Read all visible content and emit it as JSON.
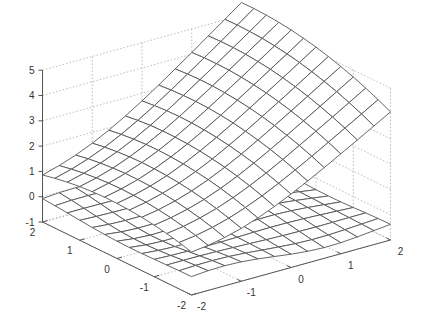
{
  "chart_data": {
    "type": "surface",
    "title": "",
    "xlabel": "",
    "ylabel": "",
    "zlabel": "",
    "grid": true,
    "view": "matlab-3d-default",
    "axes": {
      "x": {
        "range": [
          -2,
          2
        ],
        "ticks": [
          -2,
          -1,
          0,
          1,
          2
        ]
      },
      "y": {
        "range": [
          -2,
          2
        ],
        "ticks": [
          -2,
          -1,
          0,
          1,
          2
        ]
      },
      "z": {
        "range": [
          -1,
          5
        ],
        "ticks": [
          -1,
          0,
          1,
          2,
          3,
          4,
          5
        ]
      }
    },
    "tick_labels": {
      "x": [
        "-2",
        "-1",
        "0",
        "1",
        "2"
      ],
      "y": [
        "-2",
        "-1",
        "0",
        "1",
        "2"
      ],
      "z": [
        "-1",
        "0",
        "1",
        "2",
        "3",
        "4",
        "5"
      ]
    },
    "mesh_size": [
      13,
      13
    ],
    "series": [
      {
        "name": "upper surface",
        "description": "saddle-shaped surface, z≈1 at (x=-2,y=2), z≈4.8 at (x=2,y=2), z≈4 at (x=2,y=-2), dip to ≈2 in center",
        "corner_z": {
          "x-2_y2": 1.0,
          "x2_y2": 4.8,
          "x2_y-2": 4.0,
          "x-2_y-2": 0.5
        }
      },
      {
        "name": "lower surface",
        "description": "nearly flat wavy surface around z≈-0.3",
        "corner_z": {
          "x-2_y2": -0.33,
          "x2_y2": -0.2,
          "x2_y-2": -0.45,
          "x-2_y-2": -0.4
        }
      }
    ]
  },
  "colors": {
    "mesh_edge": "#555555",
    "mesh_face": "#ffffff",
    "grid": "#aaaaaa",
    "axis": "#555555",
    "text": "#333333"
  }
}
